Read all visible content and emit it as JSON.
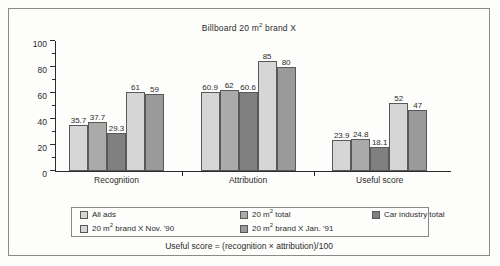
{
  "chart_data": {
    "type": "bar",
    "xlabel": "",
    "ylabel": "",
    "ylim": [
      0,
      100
    ],
    "ytick_major": [
      0,
      20,
      40,
      60,
      80,
      100
    ],
    "ytick_minor": [
      10,
      30,
      50,
      70,
      90
    ],
    "grid": false,
    "legend_position": "bottom",
    "categories": [
      "Recognition",
      "Attribution",
      "Useful score"
    ],
    "series": [
      {
        "name": "All ads",
        "values": [
          35.7,
          60.9,
          23.9
        ],
        "color": "#d6d6d6"
      },
      {
        "name": "20 m² brand X Nov. '90",
        "values": [
          37.7,
          62.0,
          24.8
        ],
        "color": "#aaaaaa"
      },
      {
        "name": "20 m² total",
        "values": [
          29.3,
          60.6,
          18.1
        ],
        "color": "#808080"
      },
      {
        "name": "20 m² brand X Jan. '91",
        "values": [
          61.0,
          85.0,
          52.0
        ],
        "color": "#d6d6d6"
      },
      {
        "name": "Car industry total",
        "values": [
          59.0,
          80.0,
          47.0
        ],
        "color": "#9a9a9a"
      }
    ],
    "data_labels": {
      "Recognition": [
        "35.7",
        "37.7",
        "29.3",
        "61",
        "59"
      ],
      "Attribution": [
        "60.9",
        "62",
        "60.6",
        "85",
        "80"
      ],
      "Useful score": [
        "23.9",
        "24.8",
        "18.1",
        "52",
        "47"
      ]
    },
    "footnote": "Useful score = (recognition × attribution)/100"
  },
  "legend": {
    "entries": [
      {
        "label": "All ads",
        "swatch": "#d6d6d6"
      },
      {
        "label": "20 m² total",
        "swatch": "#aaaaaa"
      },
      {
        "label": "Car industry total",
        "swatch": "#808080"
      },
      {
        "label": "20 m² brand X Nov. '90",
        "swatch": "#d6d6d6"
      },
      {
        "label": "20 m² brand X Jan. '91",
        "swatch": "#9a9a9a"
      }
    ]
  }
}
